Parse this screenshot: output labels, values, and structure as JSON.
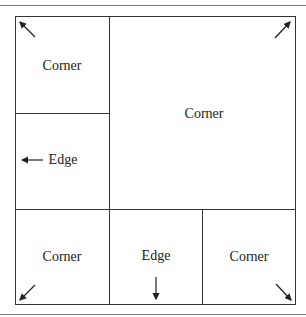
{
  "diagram": {
    "regions": [
      {
        "id": "top-left",
        "label": "Corner"
      },
      {
        "id": "center-large",
        "label": "Corner"
      },
      {
        "id": "middle-left",
        "label": "Edge",
        "arrow": "left"
      },
      {
        "id": "bottom-left",
        "label": "Corner"
      },
      {
        "id": "bottom-middle",
        "label": "Edge",
        "arrow": "down"
      },
      {
        "id": "bottom-right",
        "label": "Corner"
      }
    ],
    "arrow_color": "#222222",
    "line_color": "#333333"
  }
}
